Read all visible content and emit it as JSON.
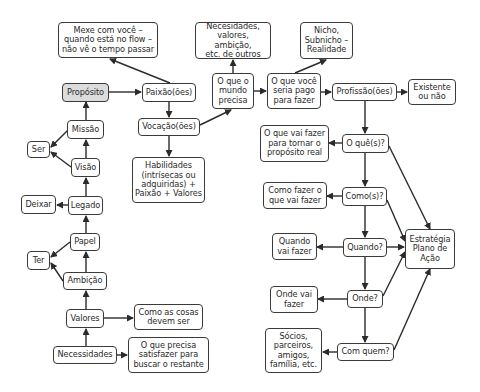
{
  "diagram": {
    "colors": {
      "stroke": "#2b2b2b",
      "node_fill": "#ffffff",
      "highlight_fill": "#dcdcdc"
    },
    "nodes": {
      "mexe": "Mexe com você –\nquando está no flow –\nnão vê o tempo passar",
      "proposito": "Propósito",
      "paixao": "Paixão(ões)",
      "vocacao": "Vocação(ões)",
      "habilidades": "Habilidades\n(intrísecas ou\nadquiridas) +\nPaixão + Valores",
      "necesidades_outros": "Necesidades,\nvalores, ambição,\netc. de outros",
      "mundo_precisa": "O que o\nmundo\nprecisa",
      "pago_fazer": "O que você\nseria pago\npara fazer",
      "nicho": "Nicho,\nSubnicho –\nRealidade",
      "profissao": "Profissão(ões)",
      "existente": "Existente\nou não",
      "missao": "Missão",
      "ser": "Ser",
      "visao": "Visão",
      "deixar": "Deixar",
      "legado": "Legado",
      "papel": "Papel",
      "ter": "Ter",
      "ambicao": "Ambição",
      "valores": "Valores",
      "como_cosas": "Como as cosas\ndevem ser",
      "necessidades": "Necessidades",
      "satisfazer": "O que precisa\nsatisfazer para\nbuscar o restante",
      "o_que_fazer": "O que vai fazer\npara tornar o\npropósito real",
      "oques": "O quê(s)?",
      "como_fazer": "Como fazer o\nque vai fazer",
      "comos": "Como(s)?",
      "quando_fazer": "Quando\nvai fazer",
      "quando": "Quando?",
      "estrategia": "Estratégia\nPlano de\nAção",
      "onde_fazer": "Onde vai\nfazer",
      "onde": "Onde?",
      "socios": "Sócios,\nparceiros,\namigos,\nfamília, etc.",
      "com_quem": "Com quem?"
    },
    "edges": [
      [
        "proposito",
        "paixao"
      ],
      [
        "paixao",
        "mexe"
      ],
      [
        "paixao",
        "vocacao"
      ],
      [
        "vocacao",
        "habilidades"
      ],
      [
        "vocacao",
        "mundo_precisa"
      ],
      [
        "mundo_precisa",
        "necesidades_outros"
      ],
      [
        "mundo_precisa",
        "pago_fazer"
      ],
      [
        "pago_fazer",
        "nicho"
      ],
      [
        "pago_fazer",
        "profissao"
      ],
      [
        "profissao",
        "existente"
      ],
      [
        "profissao",
        "oques"
      ],
      [
        "missao",
        "proposito"
      ],
      [
        "missao",
        "ser"
      ],
      [
        "visao",
        "ser"
      ],
      [
        "visao",
        "missao"
      ],
      [
        "legado",
        "visao"
      ],
      [
        "legado",
        "deixar"
      ],
      [
        "papel",
        "legado"
      ],
      [
        "papel",
        "ter"
      ],
      [
        "ambicao",
        "ter"
      ],
      [
        "ambicao",
        "papel"
      ],
      [
        "valores",
        "ambicao"
      ],
      [
        "valores",
        "como_cosas"
      ],
      [
        "necessidades",
        "valores"
      ],
      [
        "necessidades",
        "satisfazer"
      ],
      [
        "oques",
        "o_que_fazer"
      ],
      [
        "oques",
        "comos"
      ],
      [
        "oques",
        "estrategia"
      ],
      [
        "comos",
        "como_fazer"
      ],
      [
        "comos",
        "quando"
      ],
      [
        "comos",
        "estrategia"
      ],
      [
        "quando",
        "quando_fazer"
      ],
      [
        "quando",
        "onde"
      ],
      [
        "quando",
        "estrategia"
      ],
      [
        "onde",
        "onde_fazer"
      ],
      [
        "onde",
        "com_quem"
      ],
      [
        "onde",
        "estrategia"
      ],
      [
        "com_quem",
        "socios"
      ],
      [
        "com_quem",
        "estrategia"
      ]
    ]
  }
}
